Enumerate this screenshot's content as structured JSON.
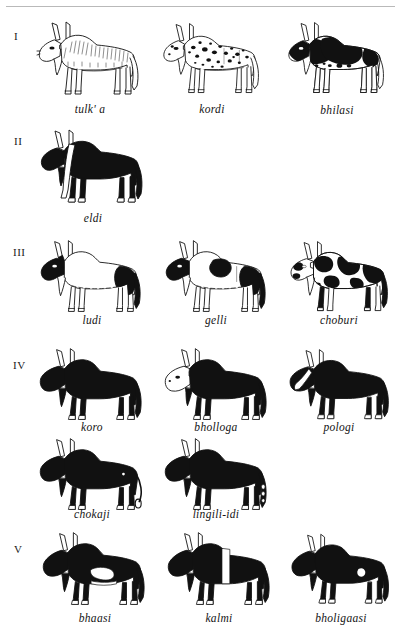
{
  "plate": {
    "title": "Cattle colour-pattern terminology plate",
    "background_color": "#ffffff",
    "ink_color": "#000000",
    "rule_color": "#b9b9b9",
    "width": 401,
    "height": 644
  },
  "groups": [
    {
      "numeral": "I",
      "rows": [
        {
          "animals": [
            {
              "label": "tulk' a",
              "pattern": "outline-white-shaded"
            },
            {
              "label": "kordi",
              "pattern": "white-with-small-black-spots"
            },
            {
              "label": "bhilasi",
              "pattern": "white-with-large-black-patches"
            }
          ]
        }
      ]
    },
    {
      "numeral": "II",
      "rows": [
        {
          "animals": [
            {
              "label": "eldi",
              "pattern": "black-with-white-shoulder-stripe"
            }
          ]
        }
      ]
    },
    {
      "numeral": "III",
      "rows": [
        {
          "animals": [
            {
              "label": "ludi",
              "pattern": "white-with-black-head-and-rump"
            },
            {
              "label": "gelli",
              "pattern": "white-with-black-head-shoulder-and-rump"
            },
            {
              "label": "choburi",
              "pattern": "white-with-many-black-blotches"
            }
          ]
        }
      ]
    },
    {
      "numeral": "IV",
      "rows": [
        {
          "animals": [
            {
              "label": "koro",
              "pattern": "solid-black"
            },
            {
              "label": "bholloga",
              "pattern": "black-with-white-head"
            },
            {
              "label": "pologi",
              "pattern": "black-with-white-face-blaze"
            }
          ]
        },
        {
          "animals": [
            {
              "label": "chokaji",
              "pattern": "black-with-white-flank-dot"
            },
            {
              "label": "lingili-idi",
              "pattern": "black-with-white-tail-markings"
            }
          ]
        }
      ]
    },
    {
      "numeral": "V",
      "rows": [
        {
          "animals": [
            {
              "label": "bhaasi",
              "pattern": "black-with-white-belly-patch"
            },
            {
              "label": "kalmi",
              "pattern": "black-with-white-vertical-belt"
            },
            {
              "label": "bholigaasi",
              "pattern": "black-with-small-white-flank-mark"
            }
          ]
        }
      ]
    }
  ]
}
